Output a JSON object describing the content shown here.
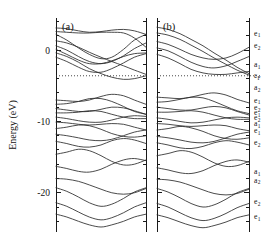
{
  "figure": {
    "kind": "electronic-band-structure",
    "panels": [
      {
        "id": "a",
        "label": "(a)"
      },
      {
        "id": "b",
        "label": "(b)"
      }
    ]
  },
  "axes": {
    "ylabel": "Energy (eV)",
    "ytick_labels": [
      "0",
      "-10",
      "-20"
    ],
    "ytick_values": [
      0,
      -10,
      -20
    ],
    "ylim": [
      -25.5,
      4.5
    ],
    "major_ticks": [
      0,
      -10,
      -20
    ],
    "minor_tick_step": 2,
    "grid": false,
    "xlabel": "",
    "xtick_labels": []
  },
  "fermi": {
    "label": "e_F",
    "symbol": "ε",
    "subscript": "F",
    "value": -3.6,
    "style": "dotted"
  },
  "state_labels": [
    {
      "symbol": "e",
      "sub": "1",
      "energy": 2.4
    },
    {
      "symbol": "e",
      "sub": "2",
      "energy": 0.6
    },
    {
      "symbol": "a",
      "sub": "1",
      "energy": -2.0
    },
    {
      "symbol": "ε",
      "sub": "F",
      "energy": -3.6
    },
    {
      "symbol": "a",
      "sub": "2",
      "energy": -5.2
    },
    {
      "symbol": "e",
      "sub": "1",
      "energy": -7.0
    },
    {
      "symbol": "e",
      "sub": "2",
      "energy": -8.0
    },
    {
      "symbol": "e",
      "sub": "1",
      "energy": -8.8
    },
    {
      "symbol": "e",
      "sub": "2",
      "energy": -9.5
    },
    {
      "symbol": "a",
      "sub": "1",
      "energy": -10.3
    },
    {
      "symbol": "e",
      "sub": "1",
      "energy": -11.3
    },
    {
      "symbol": "e",
      "sub": "2",
      "energy": -13.0
    },
    {
      "symbol": "a",
      "sub": "1",
      "energy": -17.0
    },
    {
      "symbol": "a",
      "sub": "2",
      "energy": -18.2
    },
    {
      "symbol": "e",
      "sub": "2",
      "energy": -21.2
    },
    {
      "symbol": "e",
      "sub": "1",
      "energy": -23.3
    }
  ],
  "chart_data": {
    "type": "line",
    "title": "",
    "xlabel": "",
    "ylabel": "Energy (eV)",
    "ylim": [
      -25.5,
      4.5
    ],
    "xlim": [
      0,
      1
    ],
    "grid": false,
    "legend": "none",
    "annotations": [
      "(a)",
      "(b)"
    ],
    "fermi_level": -3.6,
    "panels": [
      {
        "id": "a",
        "label": "(a)",
        "x": [
          0,
          0.12,
          0.25,
          0.37,
          0.5,
          0.62,
          0.75,
          0.87,
          1.0
        ],
        "series": [
          {
            "name": "a-band-01",
            "values": [
              3.1,
              3.0,
              2.7,
              2.5,
              2.6,
              2.8,
              2.9,
              2.7,
              2.2
            ]
          },
          {
            "name": "a-band-02",
            "values": [
              2.6,
              2.5,
              2.4,
              2.4,
              2.5,
              2.5,
              2.4,
              1.7,
              0.4
            ]
          },
          {
            "name": "a-band-03",
            "values": [
              2.2,
              1.4,
              0.3,
              -0.6,
              -1.2,
              -1.0,
              0.1,
              1.4,
              2.2
            ]
          },
          {
            "name": "a-band-04",
            "values": [
              1.3,
              1.0,
              0.4,
              -0.3,
              -1.0,
              -1.6,
              -2.2,
              -2.8,
              -3.4
            ]
          },
          {
            "name": "a-band-05",
            "values": [
              0.6,
              0.0,
              -0.9,
              -1.6,
              -1.9,
              -1.6,
              -0.8,
              0.2,
              1.0
            ]
          },
          {
            "name": "a-band-06",
            "values": [
              0.1,
              -0.6,
              -1.4,
              -1.9,
              -1.9,
              -1.5,
              -0.9,
              -0.5,
              -0.4
            ]
          },
          {
            "name": "a-band-07",
            "values": [
              -0.4,
              -0.9,
              -1.7,
              -2.6,
              -3.3,
              -3.8,
              -4.1,
              -4.0,
              -3.6
            ]
          },
          {
            "name": "a-band-08",
            "values": [
              -1.0,
              -1.6,
              -2.4,
              -3.0,
              -3.1,
              -2.6,
              -1.8,
              -1.0,
              -0.5
            ]
          },
          {
            "name": "a-band-09",
            "values": [
              -7.0,
              -7.1,
              -7.2,
              -7.0,
              -6.5,
              -6.2,
              -6.4,
              -7.0,
              -7.6
            ]
          },
          {
            "name": "a-band-10",
            "values": [
              -7.6,
              -7.5,
              -7.2,
              -6.8,
              -6.8,
              -7.2,
              -7.9,
              -8.6,
              -9.0
            ]
          },
          {
            "name": "a-band-11",
            "values": [
              -8.2,
              -8.4,
              -8.6,
              -8.6,
              -8.3,
              -8.0,
              -8.1,
              -8.5,
              -9.0
            ]
          },
          {
            "name": "a-band-12",
            "values": [
              -8.8,
              -8.8,
              -8.7,
              -8.5,
              -8.6,
              -9.0,
              -9.4,
              -9.6,
              -9.6
            ]
          },
          {
            "name": "a-band-13",
            "values": [
              -9.4,
              -9.6,
              -9.9,
              -10.1,
              -10.1,
              -9.8,
              -9.4,
              -9.2,
              -9.3
            ]
          },
          {
            "name": "a-band-14",
            "values": [
              -10.1,
              -10.2,
              -10.4,
              -10.5,
              -10.4,
              -10.3,
              -10.4,
              -10.8,
              -11.2
            ]
          },
          {
            "name": "a-band-15",
            "values": [
              -11.0,
              -10.8,
              -10.5,
              -10.6,
              -11.1,
              -11.7,
              -12.1,
              -12.2,
              -12.0
            ]
          },
          {
            "name": "a-band-16",
            "values": [
              -11.8,
              -12.0,
              -12.3,
              -12.6,
              -12.7,
              -12.5,
              -12.0,
              -11.5,
              -11.2
            ]
          },
          {
            "name": "a-band-17",
            "values": [
              -12.8,
              -13.1,
              -13.5,
              -13.6,
              -13.3,
              -12.7,
              -12.4,
              -12.6,
              -13.1
            ]
          },
          {
            "name": "a-band-18",
            "values": [
              -14.6,
              -14.3,
              -13.9,
              -14.1,
              -14.8,
              -15.6,
              -16.1,
              -16.0,
              -15.4
            ]
          },
          {
            "name": "a-band-19",
            "values": [
              -16.3,
              -16.6,
              -17.0,
              -17.1,
              -16.7,
              -16.0,
              -15.4,
              -15.2,
              -15.5
            ]
          },
          {
            "name": "a-band-20",
            "values": [
              -18.0,
              -18.1,
              -18.4,
              -18.9,
              -19.5,
              -20.0,
              -20.2,
              -20.0,
              -19.4
            ]
          },
          {
            "name": "a-band-21",
            "values": [
              -19.3,
              -19.8,
              -20.6,
              -21.4,
              -21.9,
              -21.6,
              -20.8,
              -19.9,
              -19.3
            ]
          },
          {
            "name": "a-band-22",
            "values": [
              -21.4,
              -21.9,
              -22.7,
              -23.4,
              -23.8,
              -23.5,
              -22.8,
              -22.0,
              -21.4
            ]
          },
          {
            "name": "a-band-23",
            "values": [
              -23.0,
              -23.4,
              -24.0,
              -24.5,
              -24.8,
              -24.5,
              -24.0,
              -23.4,
              -23.0
            ]
          }
        ]
      },
      {
        "id": "b",
        "label": "(b)",
        "x": [
          0,
          0.12,
          0.25,
          0.37,
          0.5,
          0.62,
          0.75,
          0.87,
          1.0
        ],
        "series": [
          {
            "name": "b-band-01",
            "values": [
              3.2,
              2.9,
              2.3,
              1.5,
              0.6,
              -0.4,
              -1.4,
              -2.4,
              -3.3
            ]
          },
          {
            "name": "b-band-02",
            "values": [
              2.4,
              2.1,
              1.5,
              0.7,
              -0.2,
              -1.1,
              -2.0,
              -2.8,
              -3.5
            ]
          },
          {
            "name": "b-band-03",
            "values": [
              1.2,
              0.8,
              0.1,
              -0.6,
              -1.1,
              -1.3,
              -1.1,
              -0.5,
              0.4
            ]
          },
          {
            "name": "b-band-04",
            "values": [
              0.3,
              -0.1,
              -0.9,
              -1.7,
              -2.3,
              -2.5,
              -2.2,
              -1.6,
              -0.9
            ]
          },
          {
            "name": "b-band-05",
            "values": [
              -0.6,
              -1.1,
              -1.9,
              -2.7,
              -3.2,
              -3.4,
              -3.4,
              -3.2,
              -3.0
            ]
          },
          {
            "name": "b-band-06",
            "values": [
              -6.6,
              -6.7,
              -6.8,
              -6.6,
              -6.2,
              -6.0,
              -6.3,
              -6.9,
              -7.4
            ]
          },
          {
            "name": "b-band-07",
            "values": [
              -7.3,
              -7.2,
              -6.9,
              -6.6,
              -6.7,
              -7.2,
              -7.9,
              -8.5,
              -8.9
            ]
          },
          {
            "name": "b-band-08",
            "values": [
              -8.0,
              -8.2,
              -8.4,
              -8.4,
              -8.1,
              -7.9,
              -8.1,
              -8.6,
              -9.1
            ]
          },
          {
            "name": "b-band-09",
            "values": [
              -8.7,
              -8.7,
              -8.6,
              -8.5,
              -8.7,
              -9.1,
              -9.5,
              -9.7,
              -9.7
            ]
          },
          {
            "name": "b-band-10",
            "values": [
              -9.5,
              -9.7,
              -10.0,
              -10.2,
              -10.1,
              -9.8,
              -9.5,
              -9.4,
              -9.5
            ]
          },
          {
            "name": "b-band-11",
            "values": [
              -10.3,
              -10.4,
              -10.6,
              -10.7,
              -10.6,
              -10.5,
              -10.6,
              -11.0,
              -11.3
            ]
          },
          {
            "name": "b-band-12",
            "values": [
              -11.2,
              -11.0,
              -10.7,
              -10.9,
              -11.4,
              -12.0,
              -12.4,
              -12.5,
              -12.3
            ]
          },
          {
            "name": "b-band-13",
            "values": [
              -12.1,
              -12.3,
              -12.6,
              -12.9,
              -13.0,
              -12.8,
              -12.3,
              -11.8,
              -11.5
            ]
          },
          {
            "name": "b-band-14",
            "values": [
              -13.0,
              -13.3,
              -13.7,
              -13.8,
              -13.5,
              -13.0,
              -12.7,
              -12.9,
              -13.3
            ]
          },
          {
            "name": "b-band-15",
            "values": [
              -14.8,
              -14.5,
              -14.1,
              -14.3,
              -15.0,
              -15.8,
              -16.3,
              -16.2,
              -15.6
            ]
          },
          {
            "name": "b-band-16",
            "values": [
              -16.5,
              -16.8,
              -17.2,
              -17.3,
              -16.9,
              -16.2,
              -15.6,
              -15.4,
              -15.7
            ]
          },
          {
            "name": "b-band-17",
            "values": [
              -18.1,
              -18.2,
              -18.5,
              -19.0,
              -19.6,
              -20.1,
              -20.3,
              -20.1,
              -19.5
            ]
          },
          {
            "name": "b-band-18",
            "values": [
              -19.4,
              -19.9,
              -20.7,
              -21.5,
              -22.0,
              -21.7,
              -20.9,
              -20.0,
              -19.4
            ]
          },
          {
            "name": "b-band-19",
            "values": [
              -21.5,
              -22.0,
              -22.8,
              -23.5,
              -23.9,
              -23.6,
              -22.9,
              -22.1,
              -21.5
            ]
          },
          {
            "name": "b-band-20",
            "values": [
              -23.1,
              -23.5,
              -24.1,
              -24.6,
              -24.9,
              -24.6,
              -24.1,
              -23.5,
              -23.1
            ]
          }
        ]
      }
    ]
  }
}
